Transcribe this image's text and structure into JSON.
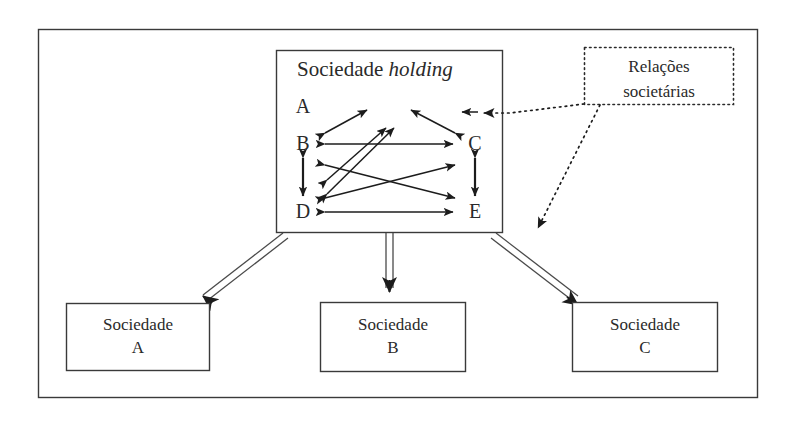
{
  "diagram": {
    "outer_frame": {
      "name": "grupo-societario"
    },
    "holding": {
      "title_main": "Sociedade ",
      "title_italic": "holding",
      "nodes": [
        {
          "id": "A",
          "label": "A",
          "x": 303,
          "y": 106
        },
        {
          "id": "B",
          "label": "B",
          "x": 303,
          "y": 143
        },
        {
          "id": "D",
          "label": "D",
          "x": 303,
          "y": 211
        },
        {
          "id": "C",
          "label": "C",
          "x": 475,
          "y": 143
        },
        {
          "id": "E",
          "label": "E",
          "x": 475,
          "y": 211
        }
      ]
    },
    "legend": {
      "line1": "Relações",
      "line2": "societárias"
    },
    "subsidiaries": [
      {
        "name": "Sociedade",
        "letter": "A"
      },
      {
        "name": "Sociedade",
        "letter": "B"
      },
      {
        "name": "Sociedade",
        "letter": "C"
      }
    ],
    "colors": {
      "stroke": "#333333",
      "text": "#2a2a2a",
      "background": "#ffffff",
      "arrow_fill": "#1c1c1c"
    }
  }
}
